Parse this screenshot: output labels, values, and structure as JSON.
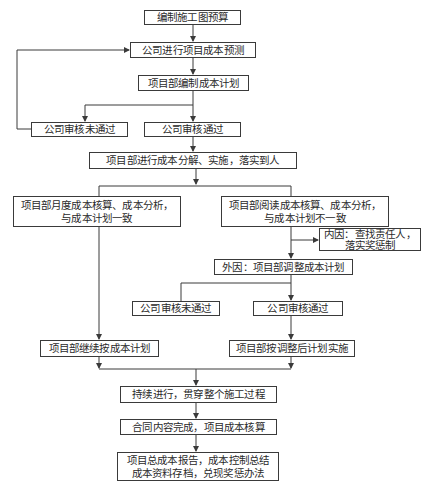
{
  "diagram": {
    "type": "flowchart",
    "nodes": {
      "n1": {
        "label": "编制施工图预算"
      },
      "n2": {
        "label": "公司进行项目成本预测"
      },
      "n3": {
        "label": "项目部编制成本计划"
      },
      "n4a": {
        "label": "公司审核未通过"
      },
      "n4b": {
        "label": "公司审核通过"
      },
      "n5": {
        "label": "项目部进行成本分解、实施，落实到人"
      },
      "n6a": {
        "line1": "项目部月度成本核算、成本分析，",
        "line2": "与成本计划一致"
      },
      "n6b": {
        "line1": "项目部阅读成本核算、成本分析，",
        "line2": "与成本计划不一致"
      },
      "n7": {
        "line1": "内因：查找责任人，",
        "line2": "落实奖惩制"
      },
      "n8": {
        "label": "外因：项目部调整成本计划"
      },
      "n9a": {
        "label": "公司审核未通过"
      },
      "n9b": {
        "label": "公司审核通过"
      },
      "n10a": {
        "label": "项目部继续按成本计划"
      },
      "n10b": {
        "label": "项目部按调整后计划实施"
      },
      "n11": {
        "label": "持续进行，贯穿整个施工过程"
      },
      "n12": {
        "label": "合同内容完成，项目成本核算"
      },
      "n13": {
        "line1": "项目总成本报告，成本控制总结",
        "line2": "成本资料存档，兑现奖惩办法"
      }
    },
    "edges": [
      [
        "n1",
        "n2"
      ],
      [
        "n2",
        "n3"
      ],
      [
        "n3",
        "n4a"
      ],
      [
        "n3",
        "n4b"
      ],
      [
        "n4a",
        "n2"
      ],
      [
        "n4b",
        "n5"
      ],
      [
        "n5",
        "n6a"
      ],
      [
        "n5",
        "n6b"
      ],
      [
        "n6b",
        "n7"
      ],
      [
        "n6b",
        "n8"
      ],
      [
        "n8",
        "n9a"
      ],
      [
        "n8",
        "n9b"
      ],
      [
        "n6a",
        "n10a"
      ],
      [
        "n9b",
        "n10b"
      ],
      [
        "n10a",
        "n11"
      ],
      [
        "n10b",
        "n11"
      ],
      [
        "n11",
        "n12"
      ],
      [
        "n12",
        "n13"
      ]
    ],
    "colors": {
      "stroke": "#3a3a3a",
      "text": "#2a2a2a",
      "background": "#ffffff"
    }
  }
}
